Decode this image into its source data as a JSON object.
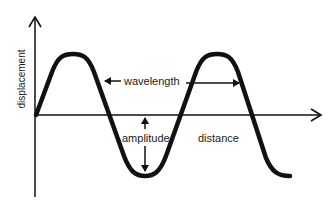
{
  "diagram": {
    "type": "transverse-wave",
    "labels": {
      "y_axis": "displacement",
      "x_axis": "distance",
      "wavelength": "wavelength",
      "amplitude": "amplitude"
    },
    "colors": {
      "background": "#ffffff",
      "line": "#111111",
      "text": "#1a1a1a"
    }
  }
}
